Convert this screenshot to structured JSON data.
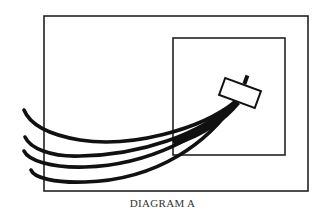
{
  "diagram": {
    "caption": "DIAGRAM A",
    "colors": {
      "background": "#ffffff",
      "stroke": "#111111",
      "caption": "#333333"
    },
    "outer_frame": {
      "x": 44,
      "y": 16,
      "width": 264,
      "height": 175
    },
    "inner_frame": {
      "x": 173,
      "y": 38,
      "width": 112,
      "height": 117
    },
    "device": {
      "label": "",
      "shape": "tilted rectangle with small post on top",
      "center": [
        240,
        93
      ],
      "rotation_deg": 20
    },
    "cables": {
      "count": 4,
      "description": "Four thick curved cables fan out from the device and exit the outer frame on the left"
    }
  }
}
